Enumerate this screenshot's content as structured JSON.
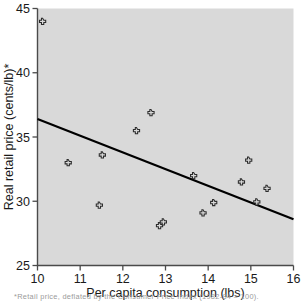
{
  "figure": {
    "background_color": "#ffffff",
    "plot_background_color": "#d9d9d9",
    "axis_color": "#4a4a4a",
    "line_color": "#000000",
    "marker_color": "#2b2b2b"
  },
  "caption": {
    "partial_text": "*Retail price, deflated by the Consumer Price Index (1982-84 = 100)."
  },
  "chart_data": {
    "type": "scatter",
    "title": "",
    "xlabel": "Per capita consumption (lbs)",
    "ylabel": "Real retail price (cents/lb)*",
    "xlim": [
      10,
      16
    ],
    "ylim": [
      25,
      45
    ],
    "xticks": [
      10,
      11,
      12,
      13,
      14,
      15,
      16
    ],
    "xtick_labels": [
      "10",
      "11",
      "12",
      "13",
      "14",
      "15",
      "16"
    ],
    "yticks": [
      25,
      30,
      35,
      40,
      45
    ],
    "ytick_labels": [
      "25",
      "30",
      "35",
      "40",
      "45"
    ],
    "grid": false,
    "legend": false,
    "marker_style": "diamond-cross",
    "points": [
      {
        "x": 10.12,
        "y": 44.0
      },
      {
        "x": 10.72,
        "y": 33.0
      },
      {
        "x": 11.45,
        "y": 29.7
      },
      {
        "x": 11.52,
        "y": 33.6
      },
      {
        "x": 12.32,
        "y": 35.5
      },
      {
        "x": 12.66,
        "y": 36.9
      },
      {
        "x": 12.86,
        "y": 28.1
      },
      {
        "x": 12.95,
        "y": 28.4
      },
      {
        "x": 13.66,
        "y": 32.0
      },
      {
        "x": 13.88,
        "y": 29.1
      },
      {
        "x": 14.13,
        "y": 29.9
      },
      {
        "x": 14.78,
        "y": 31.5
      },
      {
        "x": 14.95,
        "y": 33.2
      },
      {
        "x": 15.14,
        "y": 29.95
      },
      {
        "x": 15.38,
        "y": 31.0
      }
    ],
    "trend_line": {
      "type": "linear-fit",
      "x_start": 10,
      "y_start": 36.4,
      "x_end": 16,
      "y_end": 28.6
    }
  }
}
